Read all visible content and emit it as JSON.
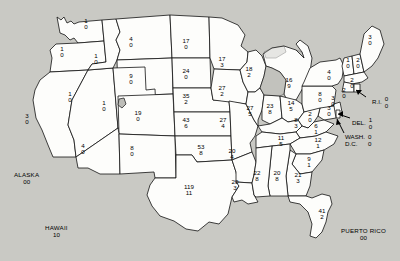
{
  "map": {
    "title": "United States distribution map",
    "background_color": "#c9c9c4",
    "land_color": "#fdfdfb",
    "lake_color": "#bdbdb8",
    "border_color": "#111111",
    "value_format": "two stacked numbers per state (upper value / lower value)",
    "states": [
      {
        "code": "WA",
        "x": 86,
        "y": 25,
        "v1": "1",
        "v2": "0"
      },
      {
        "code": "OR",
        "x": 62,
        "y": 53,
        "v1": "1",
        "v2": "0"
      },
      {
        "code": "ID",
        "x": 96,
        "y": 60,
        "v1": "1",
        "v2": "0"
      },
      {
        "code": "MT",
        "x": 131,
        "y": 43,
        "v1": "4",
        "v2": "0"
      },
      {
        "code": "ND",
        "x": 186,
        "y": 45,
        "v1": "17",
        "v2": "0"
      },
      {
        "code": "SD",
        "x": 186,
        "y": 75,
        "v1": "24",
        "v2": "0"
      },
      {
        "code": "MN",
        "x": 222,
        "y": 63,
        "v1": "17",
        "v2": "3"
      },
      {
        "code": "WY",
        "x": 131,
        "y": 80,
        "v1": "9",
        "v2": "0"
      },
      {
        "code": "NE",
        "x": 186,
        "y": 100,
        "v1": "35",
        "v2": "2"
      },
      {
        "code": "IA",
        "x": 222,
        "y": 92,
        "v1": "27",
        "v2": "2"
      },
      {
        "code": "WI",
        "x": 249,
        "y": 73,
        "v1": "18",
        "v2": "2"
      },
      {
        "code": "MI",
        "x": 289,
        "y": 84,
        "v1": "16",
        "v2": "9"
      },
      {
        "code": "NV",
        "x": 70,
        "y": 98,
        "v1": "1",
        "v2": "0"
      },
      {
        "code": "UT",
        "x": 104,
        "y": 107,
        "v1": "1",
        "v2": "0"
      },
      {
        "code": "CO",
        "x": 138,
        "y": 117,
        "v1": "19",
        "v2": "0"
      },
      {
        "code": "KS",
        "x": 186,
        "y": 124,
        "v1": "43",
        "v2": "6"
      },
      {
        "code": "MO",
        "x": 223,
        "y": 124,
        "v1": "27",
        "v2": "4"
      },
      {
        "code": "IL",
        "x": 250,
        "y": 112,
        "v1": "27",
        "v2": "5"
      },
      {
        "code": "IN",
        "x": 270,
        "y": 110,
        "v1": "23",
        "v2": "8"
      },
      {
        "code": "OH",
        "x": 291,
        "y": 107,
        "v1": "14",
        "v2": "5"
      },
      {
        "code": "PA",
        "x": 320,
        "y": 98,
        "v1": "8",
        "v2": "0"
      },
      {
        "code": "NY",
        "x": 329,
        "y": 76,
        "v1": "4",
        "v2": "0"
      },
      {
        "code": "VT",
        "x": 348,
        "y": 64,
        "v1": "1",
        "v2": "0"
      },
      {
        "code": "NH",
        "x": 358,
        "y": 64,
        "v1": "2",
        "v2": "0"
      },
      {
        "code": "ME",
        "x": 370,
        "y": 41,
        "v1": "3",
        "v2": "0"
      },
      {
        "code": "MA",
        "x": 352,
        "y": 84,
        "v1": "2",
        "v2": "0"
      },
      {
        "code": "CT",
        "x": 344,
        "y": 94,
        "v1": "2",
        "v2": "0"
      },
      {
        "code": "NJ",
        "x": 333,
        "y": 102,
        "v1": "3",
        "v2": "0"
      },
      {
        "code": "CA",
        "x": 27,
        "y": 120,
        "v1": "3",
        "v2": "0"
      },
      {
        "code": "AZ",
        "x": 83,
        "y": 150,
        "v1": "4",
        "v2": "0"
      },
      {
        "code": "NM",
        "x": 132,
        "y": 152,
        "v1": "8",
        "v2": "0"
      },
      {
        "code": "OK",
        "x": 201,
        "y": 151,
        "v1": "53",
        "v2": "8"
      },
      {
        "code": "AR",
        "x": 232,
        "y": 155,
        "v1": "20",
        "v2": "4"
      },
      {
        "code": "KY",
        "x": 296,
        "y": 124,
        "v1": "8",
        "v2": "3"
      },
      {
        "code": "WV",
        "x": 310,
        "y": 118,
        "v1": "2",
        "v2": "0"
      },
      {
        "code": "MD",
        "x": 329,
        "y": 112,
        "v1": "3",
        "v2": "0"
      },
      {
        "code": "VA",
        "x": 316,
        "y": 130,
        "v1": "6",
        "v2": "1"
      },
      {
        "code": "TN",
        "x": 281,
        "y": 142,
        "v1": "11",
        "v2": "5"
      },
      {
        "code": "NC",
        "x": 318,
        "y": 144,
        "v1": "12",
        "v2": "1"
      },
      {
        "code": "SC",
        "x": 309,
        "y": 163,
        "v1": "9",
        "v2": "1"
      },
      {
        "code": "MS",
        "x": 257,
        "y": 177,
        "v1": "22",
        "v2": "8"
      },
      {
        "code": "AL",
        "x": 277,
        "y": 177,
        "v1": "20",
        "v2": "8"
      },
      {
        "code": "GA",
        "x": 298,
        "y": 179,
        "v1": "21",
        "v2": "3"
      },
      {
        "code": "LA",
        "x": 235,
        "y": 186,
        "v1": "20",
        "v2": "3"
      },
      {
        "code": "TX",
        "x": 189,
        "y": 191,
        "v1": "119",
        "v2": "11"
      },
      {
        "code": "FL",
        "x": 322,
        "y": 215,
        "v1": "41",
        "v2": "2"
      }
    ],
    "offmap_labels": [
      {
        "name": "ALASKA",
        "x": 14,
        "y": 172,
        "v1": "0",
        "v2": "0"
      },
      {
        "name": "HAWAII",
        "x": 45,
        "y": 225,
        "v1": "1",
        "v2": "0"
      },
      {
        "name": "PUERTO RICO",
        "x": 341,
        "y": 228,
        "v1": "0",
        "v2": "0"
      }
    ],
    "callout_labels": [
      {
        "name": "R.I.",
        "x": 372,
        "y": 96,
        "v1": "0",
        "v2": "0"
      },
      {
        "name": "DEL.",
        "x": 352,
        "y": 117,
        "v1": "1",
        "v2": "0"
      },
      {
        "name": "WASH.",
        "name2": "D.C.",
        "x": 345,
        "y": 134,
        "v1": "0",
        "v2": "0"
      }
    ]
  }
}
